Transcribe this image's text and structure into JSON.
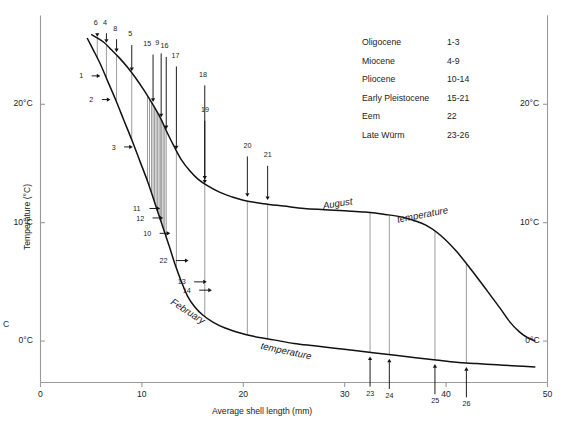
{
  "chart_data": {
    "type": "line",
    "title": "",
    "xlabel": "Average shell length (mm)",
    "ylabel": "Temperature (°C)",
    "xlim": [
      0,
      50
    ],
    "ylim": [
      -3.5,
      27.5
    ],
    "grid": false,
    "xticks": [
      0,
      10,
      20,
      30,
      40,
      50
    ],
    "xticklabels": [
      "0",
      "10",
      "20",
      "30",
      "40",
      "50"
    ],
    "yticks": [
      0,
      10,
      20
    ],
    "yticklabels_left": [
      "0°C",
      "10°C",
      "20°C"
    ],
    "yticklabels_right": [
      "0°C",
      "10°C",
      "20°C"
    ],
    "series": [
      {
        "name": "August temperature",
        "label": "August",
        "label2": "temperature",
        "points": [
          [
            5.0,
            25.9
          ],
          [
            5.6,
            25.6
          ],
          [
            6.3,
            25.2
          ],
          [
            7.0,
            24.6
          ],
          [
            7.8,
            23.9
          ],
          [
            8.6,
            23.1
          ],
          [
            9.4,
            22.2
          ],
          [
            10.2,
            21.2
          ],
          [
            11.0,
            20.1
          ],
          [
            11.8,
            18.9
          ],
          [
            12.5,
            17.6
          ],
          [
            13.2,
            16.4
          ],
          [
            13.9,
            15.3
          ],
          [
            14.7,
            14.4
          ],
          [
            15.5,
            13.7
          ],
          [
            16.5,
            13.1
          ],
          [
            17.6,
            12.6
          ],
          [
            18.8,
            12.2
          ],
          [
            20.0,
            11.9
          ],
          [
            22.0,
            11.6
          ],
          [
            24.0,
            11.4
          ],
          [
            26.0,
            11.2
          ],
          [
            28.0,
            11.1
          ],
          [
            30.0,
            11.0
          ],
          [
            32.0,
            10.9
          ],
          [
            34.0,
            10.7
          ],
          [
            36.0,
            10.4
          ],
          [
            38.0,
            9.8
          ],
          [
            39.5,
            8.9
          ],
          [
            41.0,
            7.6
          ],
          [
            42.5,
            6.0
          ],
          [
            44.0,
            4.3
          ],
          [
            45.3,
            2.8
          ],
          [
            46.3,
            1.6
          ],
          [
            47.2,
            0.8
          ],
          [
            48.0,
            0.3
          ],
          [
            48.8,
            0.0
          ]
        ]
      },
      {
        "name": "February temperature",
        "label": "February",
        "label2": "temperature",
        "points": [
          [
            4.6,
            25.6
          ],
          [
            5.2,
            24.6
          ],
          [
            5.9,
            23.4
          ],
          [
            6.6,
            22.0
          ],
          [
            7.4,
            20.4
          ],
          [
            8.2,
            18.7
          ],
          [
            9.0,
            17.0
          ],
          [
            9.8,
            15.2
          ],
          [
            10.6,
            13.4
          ],
          [
            11.3,
            11.6
          ],
          [
            12.0,
            9.8
          ],
          [
            12.7,
            8.0
          ],
          [
            13.3,
            6.4
          ],
          [
            13.9,
            5.0
          ],
          [
            14.5,
            3.8
          ],
          [
            15.2,
            2.9
          ],
          [
            16.0,
            2.2
          ],
          [
            17.0,
            1.6
          ],
          [
            18.2,
            1.1
          ],
          [
            19.6,
            0.7
          ],
          [
            21.0,
            0.4
          ],
          [
            23.0,
            0.1
          ],
          [
            25.0,
            -0.2
          ],
          [
            27.0,
            -0.4
          ],
          [
            29.0,
            -0.6
          ],
          [
            31.0,
            -0.8
          ],
          [
            33.0,
            -1.0
          ],
          [
            35.0,
            -1.2
          ],
          [
            37.0,
            -1.4
          ],
          [
            39.0,
            -1.6
          ],
          [
            41.0,
            -1.8
          ],
          [
            43.0,
            -1.9
          ],
          [
            45.0,
            -2.0
          ],
          [
            47.0,
            -2.1
          ],
          [
            48.8,
            -2.2
          ]
        ]
      }
    ],
    "annotations_top": [
      {
        "id": "6",
        "x": 5.6,
        "label_x": 5.45,
        "label_y": 26.9,
        "arrow_to_y": 25.7
      },
      {
        "id": "4",
        "x": 6.5,
        "label_x": 6.35,
        "label_y": 26.9,
        "arrow_to_y": 25.2
      },
      {
        "id": "8",
        "x": 7.5,
        "label_x": 7.35,
        "label_y": 26.4,
        "arrow_to_y": 24.4
      },
      {
        "id": "5",
        "x": 9.0,
        "label_x": 8.85,
        "label_y": 25.9,
        "arrow_to_y": 22.8
      },
      {
        "id": "15",
        "x": 11.1,
        "label_x": 10.5,
        "label_y": 25.1,
        "arrow_to_y": 20.2
      },
      {
        "id": "9",
        "x": 11.9,
        "label_x": 11.5,
        "label_y": 25.2,
        "arrow_to_y": 18.9
      },
      {
        "id": "16",
        "x": 12.4,
        "label_x": 12.2,
        "label_y": 24.9,
        "arrow_to_y": 17.9
      },
      {
        "id": "17",
        "x": 13.4,
        "label_x": 13.3,
        "label_y": 24.1,
        "arrow_to_y": 16.2
      },
      {
        "id": "18",
        "x": 16.2,
        "label_x": 16.0,
        "label_y": 22.5,
        "arrow_to_y": 13.3
      }
    ],
    "annotations_left": [
      {
        "id": "1",
        "x": 5.9,
        "label_x": 4.3,
        "y": 22.4
      },
      {
        "id": "2",
        "x": 6.9,
        "label_x": 5.3,
        "y": 20.4
      },
      {
        "id": "3",
        "x": 9.1,
        "label_x": 7.5,
        "y": 16.4
      },
      {
        "id": "11",
        "x": 11.8,
        "label_x": 10.0,
        "y": 11.2
      },
      {
        "id": "12",
        "x": 12.1,
        "label_x": 10.3,
        "y": 10.4
      },
      {
        "id": "10",
        "x": 12.8,
        "label_x": 11.0,
        "y": 9.1
      },
      {
        "id": "22",
        "x": 14.6,
        "label_x": 12.6,
        "y": 6.8
      },
      {
        "id": "13",
        "x": 16.4,
        "label_x": 14.4,
        "y": 5.0
      },
      {
        "id": "14",
        "x": 16.9,
        "label_x": 14.9,
        "y": 4.3
      }
    ],
    "annotations_august_down": [
      {
        "id": "19",
        "x": 16.2,
        "label_y": 19.5
      },
      {
        "id": "20",
        "x": 20.4,
        "label_y": 16.5
      },
      {
        "id": "21",
        "x": 22.4,
        "label_y": 15.7
      }
    ],
    "annotations_bottom_up": [
      {
        "id": "23",
        "x": 32.5
      },
      {
        "id": "24",
        "x": 34.4
      },
      {
        "id": "25",
        "x": 38.9
      },
      {
        "id": "26",
        "x": 42.0
      }
    ],
    "connector_lines_august_to_february": [
      5.6,
      6.5,
      7.5,
      9.0,
      10.55,
      10.75,
      10.95,
      11.1,
      11.25,
      11.4,
      11.55,
      11.7,
      11.85,
      11.95,
      12.1,
      12.25,
      12.4,
      13.4,
      16.2,
      20.4,
      22.4,
      32.5,
      34.4,
      38.9,
      42.0
    ],
    "legend": {
      "rows": [
        {
          "epoch": "Oligocene",
          "range": "1-3"
        },
        {
          "epoch": "Miocene",
          "range": "4-9"
        },
        {
          "epoch": "Pliocene",
          "range": "10-14"
        },
        {
          "epoch": "Early Pleistocene",
          "range": "15-21"
        },
        {
          "epoch": "Eem",
          "range": "22"
        },
        {
          "epoch": "Late Würm",
          "range": "23-26"
        }
      ]
    },
    "stray_text": "C",
    "colors": {
      "curve": "#111111",
      "connector": "#8a8a8a",
      "axis": "#9a9a9a",
      "text": "#222222"
    }
  }
}
